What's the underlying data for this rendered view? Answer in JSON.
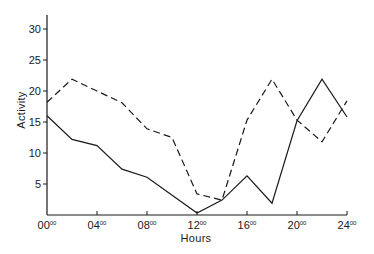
{
  "chart_data": {
    "type": "line",
    "title": "",
    "xlabel": "Hours",
    "ylabel": "Activity",
    "xlim": [
      0,
      24
    ],
    "ylim": [
      0,
      32
    ],
    "grid": false,
    "legend": null,
    "x_ticks": [
      {
        "value": 0,
        "hour": "00",
        "minutes": "00"
      },
      {
        "value": 4,
        "hour": "04",
        "minutes": "00"
      },
      {
        "value": 8,
        "hour": "08",
        "minutes": "00"
      },
      {
        "value": 12,
        "hour": "12",
        "minutes": "00"
      },
      {
        "value": 16,
        "hour": "16",
        "minutes": "00"
      },
      {
        "value": 20,
        "hour": "20",
        "minutes": "00"
      },
      {
        "value": 24,
        "hour": "24",
        "minutes": "00"
      }
    ],
    "y_ticks": [
      5,
      10,
      15,
      20,
      25,
      30
    ],
    "series": [
      {
        "name": "solid",
        "style": "solid",
        "color": "#1a1a1a",
        "points": [
          [
            0,
            16
          ],
          [
            2,
            12.2
          ],
          [
            4,
            11.2
          ],
          [
            6,
            7.4
          ],
          [
            8,
            6.1
          ],
          [
            12,
            0.3
          ],
          [
            14,
            2.4
          ],
          [
            16,
            6.3
          ],
          [
            18,
            1.9
          ],
          [
            20,
            15.2
          ],
          [
            22,
            21.9
          ],
          [
            24,
            15.8
          ]
        ]
      },
      {
        "name": "dashed",
        "style": "dashed",
        "color": "#1a1a1a",
        "points": [
          [
            0,
            18.2
          ],
          [
            2,
            21.9
          ],
          [
            4,
            20
          ],
          [
            6,
            18.1
          ],
          [
            8,
            13.9
          ],
          [
            10,
            12.5
          ],
          [
            12,
            3.4
          ],
          [
            14,
            2.4
          ],
          [
            16,
            15.3
          ],
          [
            18,
            21.9
          ],
          [
            20,
            15.3
          ],
          [
            22,
            11.8
          ],
          [
            24,
            18.4
          ]
        ]
      }
    ]
  },
  "layout": {
    "origin_x": 47,
    "origin_y": 215,
    "px_per_hour": 12.5,
    "px_per_unit": 6.2,
    "axis_top": 15
  }
}
